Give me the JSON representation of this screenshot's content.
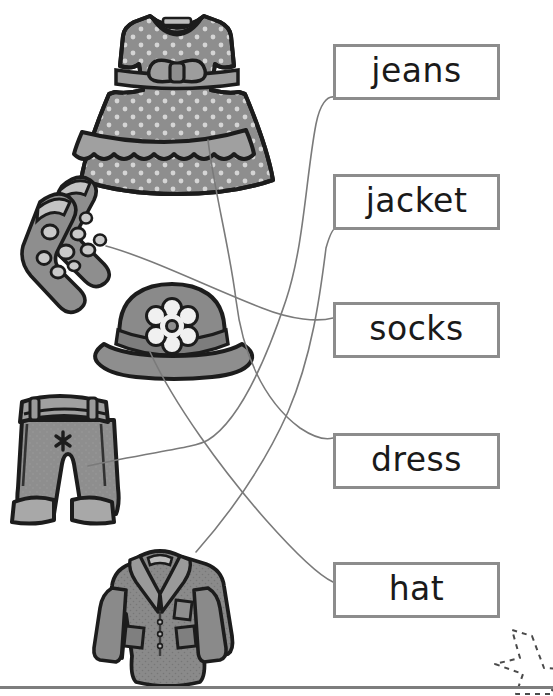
{
  "worksheet": {
    "title": "Clothes matching worksheet",
    "instruction_visible": false,
    "task_type": "match-picture-to-word"
  },
  "palette": {
    "box_border": "#8c8c8c",
    "word_text": "#1a1a1a",
    "line": "#7a7a7a",
    "garment_fill": "#8e8e8e",
    "garment_fill_dark": "#6f6f6f",
    "garment_fill_light": "#a8a8a8",
    "garment_outline": "#1c1c1c",
    "highlight": "#efefef",
    "page_rule": "#7d7d7d",
    "star_dash": "#4a4a4a",
    "background": "#ffffff"
  },
  "word_boxes": [
    {
      "id": "jeans",
      "label": "jeans",
      "x": 333,
      "y": 44,
      "w": 167,
      "h": 56
    },
    {
      "id": "jacket",
      "label": "jacket",
      "x": 333,
      "y": 174,
      "w": 167,
      "h": 56
    },
    {
      "id": "socks",
      "label": "socks",
      "x": 333,
      "y": 302,
      "w": 167,
      "h": 56
    },
    {
      "id": "dress",
      "label": "dress",
      "x": 333,
      "y": 433,
      "w": 167,
      "h": 56
    },
    {
      "id": "hat",
      "label": "hat",
      "x": 333,
      "y": 562,
      "w": 167,
      "h": 56
    }
  ],
  "pictures": [
    {
      "id": "dress-picture",
      "name": "dress",
      "alt": "grey polka dot sleeveless dress with bow belt",
      "x": 98,
      "y": 8,
      "w": 128,
      "h": 152
    },
    {
      "id": "socks-picture",
      "name": "socks",
      "alt": "pair of grey spotted socks",
      "x": 18,
      "y": 170,
      "w": 102,
      "h": 100
    },
    {
      "id": "hat-picture",
      "name": "hat",
      "alt": "wide brimmed grey hat with white flower",
      "x": 96,
      "y": 288,
      "w": 152,
      "h": 96
    },
    {
      "id": "jeans-picture",
      "name": "jeans",
      "alt": "grey jeans with belt and turned up cuffs",
      "x": 8,
      "y": 392,
      "w": 104,
      "h": 134
    },
    {
      "id": "jacket-picture",
      "name": "jacket",
      "alt": "grey jacket with lapels and pockets",
      "x": 102,
      "y": 538,
      "w": 116,
      "h": 118
    }
  ],
  "connections": [
    {
      "from": "dress-picture",
      "to": "dress",
      "correct": true
    },
    {
      "from": "socks-picture",
      "to": "socks",
      "correct": true
    },
    {
      "from": "hat-picture",
      "to": "hat",
      "correct": true
    },
    {
      "from": "jeans-picture",
      "to": "jeans",
      "correct": true
    },
    {
      "from": "jacket-picture",
      "to": "jacket",
      "correct": true
    }
  ],
  "decoration": {
    "star": {
      "name": "dashed-star-outline",
      "x": 470,
      "y": 630
    },
    "bottom_rule": true
  }
}
